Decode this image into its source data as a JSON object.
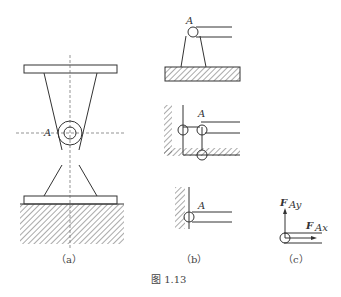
{
  "figure": {
    "caption": "图 1.13",
    "subfigures": [
      {
        "id": "a",
        "caption": "（a）",
        "point_label": "A"
      },
      {
        "id": "b",
        "caption": "（b）",
        "point_labels": [
          "A",
          "A",
          "A"
        ]
      },
      {
        "id": "c",
        "caption": "（c）",
        "forces": [
          {
            "label": "F",
            "subscript": "Ay"
          },
          {
            "label": "F",
            "subscript": "Ax"
          }
        ]
      }
    ]
  },
  "colors": {
    "line": "#333333",
    "hatch": "#555555",
    "background": "#ffffff"
  }
}
